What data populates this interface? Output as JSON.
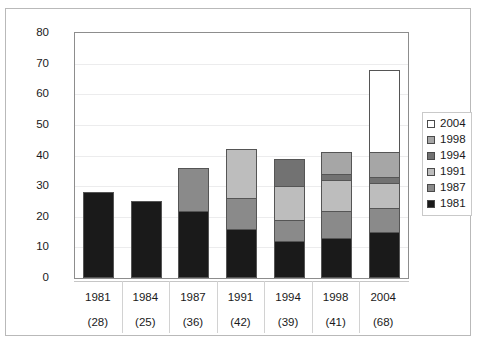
{
  "chart_data": {
    "type": "bar",
    "subtype": "stacked-bar",
    "title": "",
    "xlabel": "",
    "ylabel": "",
    "ylim": [
      0,
      80
    ],
    "ytick_step": 10,
    "yticks": [
      0,
      10,
      20,
      30,
      40,
      50,
      60,
      70,
      80
    ],
    "grid": true,
    "legend_position": "right",
    "categories": [
      "1981",
      "1984",
      "1987",
      "1991",
      "1994",
      "1998",
      "2004"
    ],
    "category_totals": [
      28,
      25,
      36,
      42,
      39,
      41,
      68
    ],
    "category_total_labels": [
      "(28)",
      "(25)",
      "(36)",
      "(42)",
      "(39)",
      "(41)",
      "(68)"
    ],
    "series": [
      {
        "name": "1981",
        "color": "#1a1a1a",
        "values": [
          28,
          25,
          22,
          16,
          12,
          13,
          15
        ]
      },
      {
        "name": "1987",
        "color": "#8a8a8a",
        "values": [
          0,
          0,
          14,
          10,
          7,
          9,
          8
        ]
      },
      {
        "name": "1991",
        "color": "#bdbdbd",
        "values": [
          0,
          0,
          0,
          16,
          11,
          10,
          8
        ]
      },
      {
        "name": "1994",
        "color": "#727272",
        "values": [
          0,
          0,
          0,
          0,
          9,
          2,
          2
        ]
      },
      {
        "name": "1998",
        "color": "#a6a6a6",
        "values": [
          0,
          0,
          0,
          0,
          0,
          7,
          8
        ]
      },
      {
        "name": "2004",
        "color": "#ffffff",
        "values": [
          0,
          0,
          0,
          0,
          0,
          0,
          27
        ]
      }
    ],
    "legend_entries": [
      {
        "label": "2004",
        "color": "#ffffff"
      },
      {
        "label": "1998",
        "color": "#a6a6a6"
      },
      {
        "label": "1994",
        "color": "#727272"
      },
      {
        "label": "1991",
        "color": "#bdbdbd"
      },
      {
        "label": "1987",
        "color": "#8a8a8a"
      },
      {
        "label": "1981",
        "color": "#1a1a1a"
      }
    ]
  }
}
